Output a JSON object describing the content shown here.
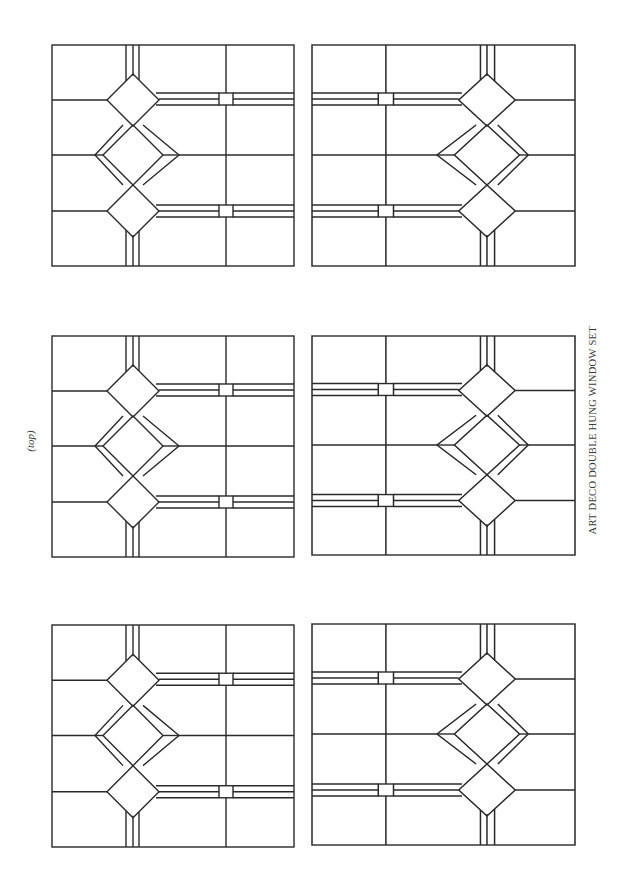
{
  "page": {
    "orientation_label": "(top)",
    "caption": "ART DECO DOUBLE HUNG WINDOW SET"
  },
  "panels": [
    {
      "id": "r1c1",
      "row": 1,
      "column": 1,
      "mirrored": false
    },
    {
      "id": "r1c2",
      "row": 1,
      "column": 2,
      "mirrored": true
    },
    {
      "id": "r2c1",
      "row": 2,
      "column": 1,
      "mirrored": false
    },
    {
      "id": "r2c2",
      "row": 2,
      "column": 2,
      "mirrored": true
    },
    {
      "id": "r3c1",
      "row": 3,
      "column": 1,
      "mirrored": false
    },
    {
      "id": "r3c2",
      "row": 3,
      "column": 2,
      "mirrored": true
    }
  ],
  "colors": {
    "line": "#2a2a2a",
    "background": "#ffffff",
    "text": "#3a3a3a"
  }
}
